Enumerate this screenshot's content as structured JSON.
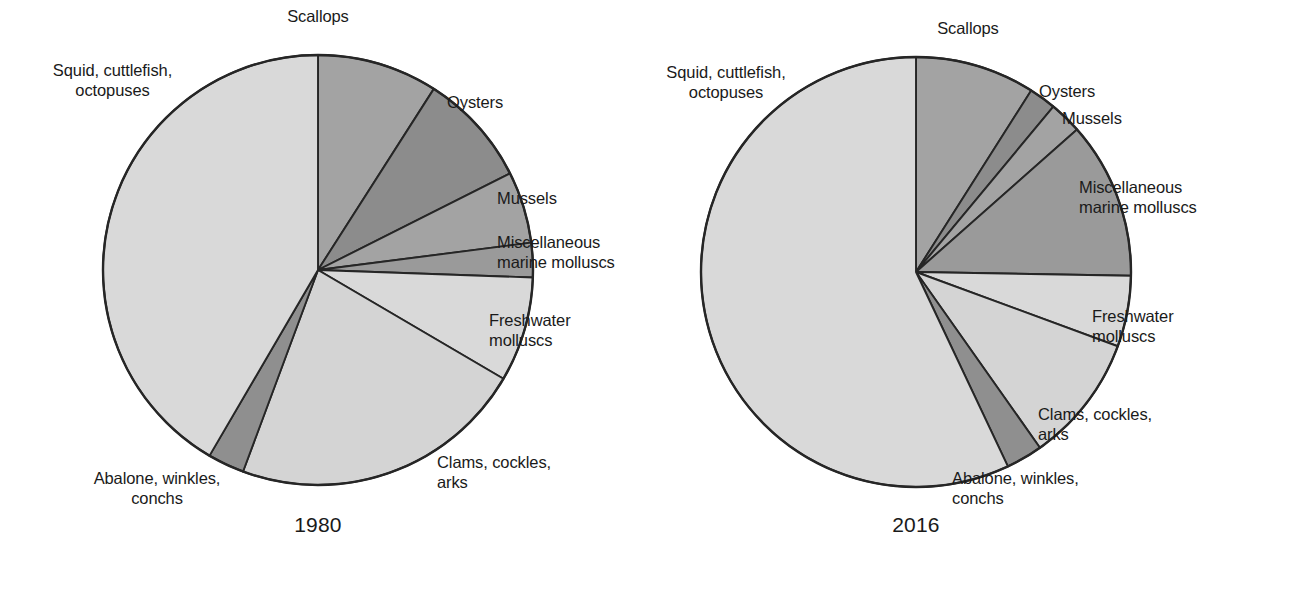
{
  "chart_data": [
    {
      "type": "pie",
      "title": "1980",
      "id": "pie-1980",
      "center": [
        318,
        270
      ],
      "radius": 215,
      "start_angle_deg": 0,
      "direction": "clockwise",
      "legend": "none",
      "grid": false,
      "categories": [
        "Scallops",
        "Oysters",
        "Mussels",
        "Miscellaneous marine molluscs",
        "Freshwater molluscs",
        "Clams, cockles, arks",
        "Abalone, winkles, conchs",
        "Squid, cuttlefish, octopuses"
      ],
      "values": [
        9.1,
        8.5,
        5.4,
        2.6,
        7.9,
        22.2,
        2.8,
        41.5
      ],
      "unit": "percent",
      "angles_deg": [
        [
          0.0,
          32.6
        ],
        [
          32.6,
          63.3
        ],
        [
          63.3,
          82.7
        ],
        [
          82.7,
          92.0
        ],
        [
          92.0,
          120.4
        ],
        [
          120.4,
          200.4
        ],
        [
          200.4,
          210.3
        ],
        [
          210.3,
          360.0
        ]
      ],
      "colors": [
        "#a3a3a3",
        "#8c8c8c",
        "#a3a3a3",
        "#9a9a9a",
        "#d9d9d9",
        "#d4d4d4",
        "#8f8f8f",
        "#d9d9d9"
      ]
    },
    {
      "type": "pie",
      "title": "2016",
      "id": "pie-2016",
      "center": [
        916,
        272
      ],
      "radius": 215,
      "start_angle_deg": 0,
      "direction": "clockwise",
      "legend": "none",
      "grid": false,
      "categories": [
        "Scallops",
        "Oysters",
        "Mussels",
        "Miscellaneous marine molluscs",
        "Freshwater molluscs",
        "Clams, cockles, arks",
        "Abalone, winkles, conchs",
        "Squid, cuttlefish, octopuses"
      ],
      "values": [
        9.0,
        2.0,
        2.5,
        11.8,
        5.3,
        9.6,
        2.8,
        57.0
      ],
      "unit": "percent",
      "angles_deg": [
        [
          0.0,
          32.4
        ],
        [
          32.4,
          39.7
        ],
        [
          39.7,
          48.5
        ],
        [
          48.5,
          91.0
        ],
        [
          91.0,
          110.2
        ],
        [
          110.2,
          144.8
        ],
        [
          144.8,
          154.7
        ],
        [
          154.7,
          360.0
        ]
      ],
      "colors": [
        "#a3a3a3",
        "#8c8c8c",
        "#a3a3a3",
        "#9a9a9a",
        "#d9d9d9",
        "#d4d4d4",
        "#8f8f8f",
        "#d9d9d9"
      ]
    }
  ],
  "left_chart": {
    "year": "1980",
    "labels": {
      "scallops": "Scallops",
      "oysters": "Oysters",
      "mussels": "Mussels",
      "misc_marine": "Miscellaneous\nmarine molluscs",
      "freshwater": "Freshwater\nmolluscs",
      "clams": "Clams, cockles,\narks",
      "abalone": "Abalone, winkles,\nconchs",
      "squid": "Squid, cuttlefish,\noctopuses"
    }
  },
  "right_chart": {
    "year": "2016",
    "labels": {
      "scallops": "Scallops",
      "oysters": "Oysters",
      "mussels": "Mussels",
      "misc_marine": "Miscellaneous\nmarine molluscs",
      "freshwater": "Freshwater\nmolluscs",
      "clams": "Clams, cockles,\narks",
      "abalone": "Abalone, winkles,\nconchs",
      "squid": "Squid, cuttlefish,\noctopuses"
    }
  },
  "style": {
    "background": "#ffffff",
    "text_color": "#1a1a1a",
    "stroke_color": "#262626"
  }
}
